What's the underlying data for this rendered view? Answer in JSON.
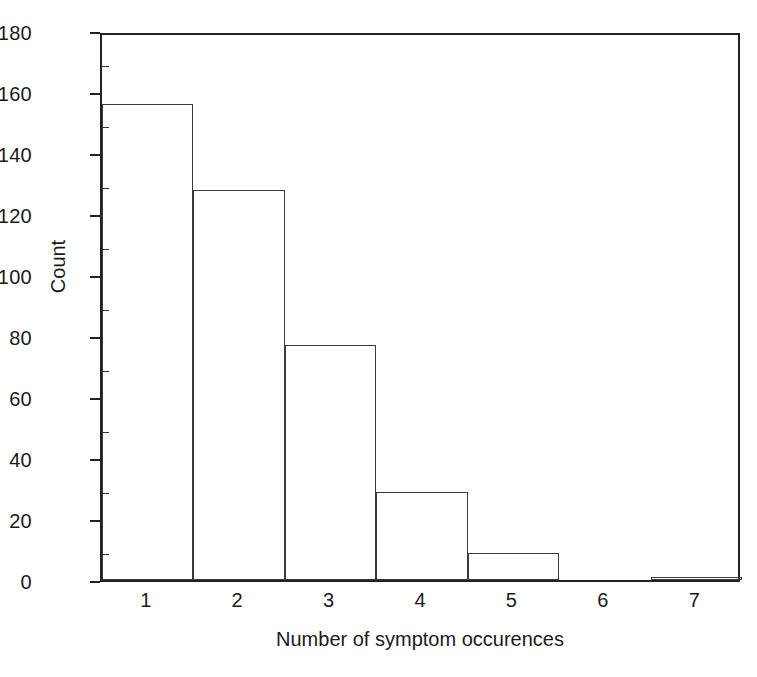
{
  "chart_data": {
    "type": "bar",
    "title": "",
    "subtitle": "",
    "xlabel": "Number of symptom occurences",
    "ylabel": "Count",
    "categories": [
      "1",
      "2",
      "3",
      "4",
      "5",
      "6",
      "7"
    ],
    "values": [
      156,
      128,
      77,
      29,
      9,
      0,
      1
    ],
    "series": [
      {
        "name": "Count",
        "values": [
          156,
          128,
          77,
          29,
          9,
          0,
          1
        ]
      }
    ],
    "xlim": [
      0.5,
      7.5
    ],
    "ylim": [
      0,
      180
    ],
    "y_ticks": [
      0,
      20,
      40,
      60,
      80,
      100,
      120,
      140,
      160,
      180
    ],
    "y_tick_labels": [
      "0",
      "20",
      "40",
      "60",
      "80",
      "100",
      "120",
      "140",
      "160",
      "180"
    ],
    "y_minor_tick_interval": 10,
    "x_ticks": [
      1,
      2,
      3,
      4,
      5,
      6,
      7
    ],
    "x_tick_labels": [
      "1",
      "2",
      "3",
      "4",
      "5",
      "6",
      "7"
    ],
    "grid": false,
    "legend": null,
    "legend_position": "none",
    "bar_style": "outline",
    "bar_fill_color": "#ffffff",
    "bar_edge_color": "#3b3b3b",
    "axis_color": "#222222",
    "background_color": "#ffffff",
    "text_color": "#1a1a1a",
    "annotations": []
  }
}
